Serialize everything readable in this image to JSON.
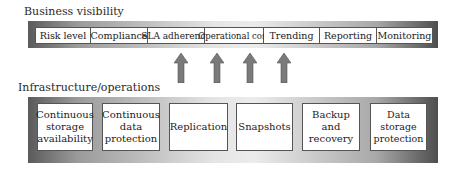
{
  "business": {
    "label": "Business visibility",
    "items": [
      "Risk level",
      "Compliance",
      "SLA adherence",
      "Operational cost",
      "Trending",
      "Reporting",
      "Monitoring"
    ]
  },
  "infrastructure": {
    "label": "Infrastructure/operations",
    "items": [
      [
        "Continuous",
        "storage",
        "availability"
      ],
      [
        "Continuous",
        "data",
        "protection"
      ],
      [
        "Replication"
      ],
      [
        "Snapshots"
      ],
      [
        "Backup and",
        "recovery"
      ],
      [
        "Data storage",
        "protection"
      ]
    ]
  },
  "arrows": {
    "count": 4,
    "direction": "up",
    "color": "#7a7a7a"
  }
}
